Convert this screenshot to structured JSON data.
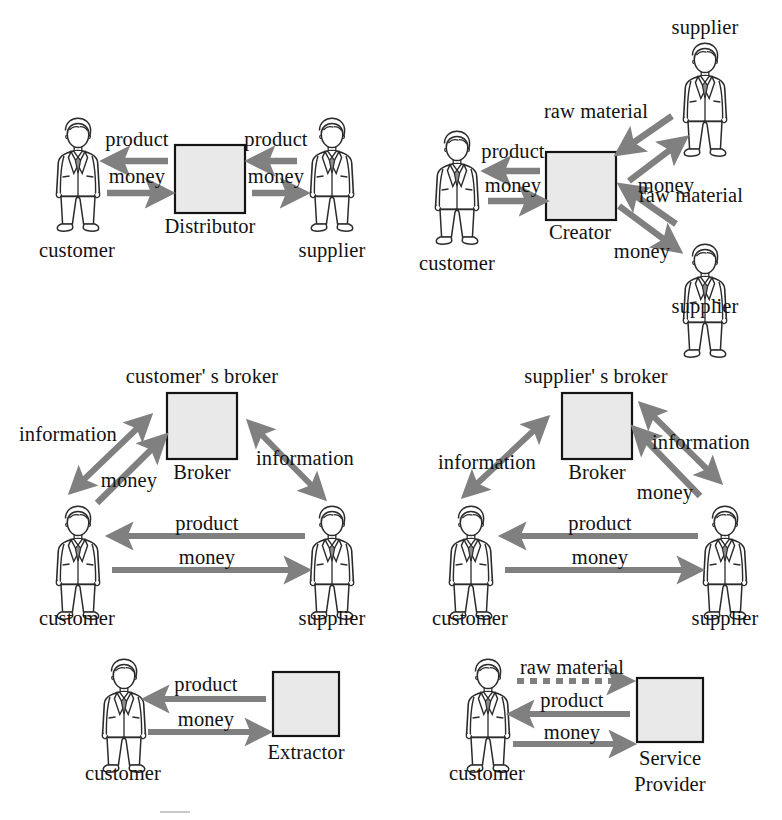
{
  "figure": {
    "panel_count": 6,
    "colors": {
      "arrow_gray": "#808080",
      "box_fill": "#e9e9e9",
      "box_border": "#141414",
      "person_outline": "#2b2b2b",
      "text": "#121212",
      "background": "#ffffff"
    }
  },
  "panels": [
    {
      "id": "distributor",
      "name": "Distributor model",
      "actors": [
        {
          "role": "person",
          "label": "customer"
        },
        {
          "role": "box",
          "label": "Distributor"
        },
        {
          "role": "person",
          "label": "supplier"
        }
      ],
      "flows": [
        {
          "label": "product",
          "from": "Distributor",
          "to": "customer",
          "direction": "left",
          "style": "solid"
        },
        {
          "label": "money",
          "from": "customer",
          "to": "Distributor",
          "direction": "right",
          "style": "solid"
        },
        {
          "label": "product",
          "from": "supplier",
          "to": "Distributor",
          "direction": "left",
          "style": "solid"
        },
        {
          "label": "money",
          "from": "Distributor",
          "to": "supplier",
          "direction": "right",
          "style": "solid"
        }
      ]
    },
    {
      "id": "creator",
      "name": "Creator model",
      "actors": [
        {
          "role": "person",
          "label": "customer"
        },
        {
          "role": "box",
          "label": "Creator"
        },
        {
          "role": "person",
          "label": "supplier"
        },
        {
          "role": "person",
          "label": "supplier"
        }
      ],
      "flows": [
        {
          "label": "product",
          "from": "Creator",
          "to": "customer",
          "direction": "left",
          "style": "solid"
        },
        {
          "label": "money",
          "from": "customer",
          "to": "Creator",
          "direction": "right",
          "style": "solid"
        },
        {
          "label": "raw material",
          "from": "supplier",
          "to": "Creator",
          "direction": "down-left",
          "style": "solid"
        },
        {
          "label": "money",
          "from": "Creator",
          "to": "supplier",
          "direction": "up-right",
          "style": "solid"
        },
        {
          "label": "raw material",
          "from": "supplier",
          "to": "Creator",
          "direction": "up-left",
          "style": "solid"
        },
        {
          "label": "money",
          "from": "Creator",
          "to": "supplier",
          "direction": "down-right",
          "style": "solid"
        }
      ]
    },
    {
      "id": "customers-broker",
      "name": "Customer's broker model",
      "heading": "customer' s broker",
      "actors": [
        {
          "role": "person",
          "label": "customer"
        },
        {
          "role": "box",
          "label": "Broker"
        },
        {
          "role": "person",
          "label": "supplier"
        }
      ],
      "flows": [
        {
          "label": "information",
          "from": "customer",
          "to": "Broker",
          "direction": "bidirectional",
          "style": "solid"
        },
        {
          "label": "money",
          "from": "customer",
          "to": "Broker",
          "direction": "up-right",
          "style": "solid"
        },
        {
          "label": "information",
          "from": "Broker",
          "to": "supplier",
          "direction": "bidirectional",
          "style": "solid"
        },
        {
          "label": "product",
          "from": "supplier",
          "to": "customer",
          "direction": "left",
          "style": "solid"
        },
        {
          "label": "money",
          "from": "customer",
          "to": "supplier",
          "direction": "right",
          "style": "solid"
        }
      ]
    },
    {
      "id": "suppliers-broker",
      "name": "Supplier's broker model",
      "heading": "supplier' s broker",
      "actors": [
        {
          "role": "person",
          "label": "customer"
        },
        {
          "role": "box",
          "label": "Broker"
        },
        {
          "role": "person",
          "label": "supplier"
        }
      ],
      "flows": [
        {
          "label": "information",
          "from": "customer",
          "to": "Broker",
          "direction": "bidirectional",
          "style": "solid"
        },
        {
          "label": "information",
          "from": "Broker",
          "to": "supplier",
          "direction": "bidirectional",
          "style": "solid"
        },
        {
          "label": "money",
          "from": "supplier",
          "to": "Broker",
          "direction": "up-left",
          "style": "solid"
        },
        {
          "label": "product",
          "from": "supplier",
          "to": "customer",
          "direction": "left",
          "style": "solid"
        },
        {
          "label": "money",
          "from": "customer",
          "to": "supplier",
          "direction": "right",
          "style": "solid"
        }
      ]
    },
    {
      "id": "extractor",
      "name": "Extractor model",
      "actors": [
        {
          "role": "person",
          "label": "customer"
        },
        {
          "role": "box",
          "label": "Extractor"
        }
      ],
      "flows": [
        {
          "label": "product",
          "from": "Extractor",
          "to": "customer",
          "direction": "left",
          "style": "solid"
        },
        {
          "label": "money",
          "from": "customer",
          "to": "Extractor",
          "direction": "right",
          "style": "solid"
        }
      ]
    },
    {
      "id": "service-provider",
      "name": "Service Provider model",
      "actors": [
        {
          "role": "person",
          "label": "customer"
        },
        {
          "role": "box",
          "label": "Service\nProvider",
          "label_line1": "Service",
          "label_line2": "Provider"
        }
      ],
      "flows": [
        {
          "label": "raw material",
          "from": "customer",
          "to": "Service Provider",
          "direction": "right",
          "style": "dashed"
        },
        {
          "label": "product",
          "from": "Service Provider",
          "to": "customer",
          "direction": "left",
          "style": "solid"
        },
        {
          "label": "money",
          "from": "customer",
          "to": "Service Provider",
          "direction": "right",
          "style": "solid"
        }
      ]
    }
  ],
  "labels": {
    "p1_product_left": "product",
    "p1_money_left": "money",
    "p1_product_right": "product",
    "p1_money_right": "money",
    "p1_customer": "customer",
    "p1_box": "Distributor",
    "p1_supplier": "supplier",
    "p2_supplier_top": "supplier",
    "p2_raw_top": "raw material",
    "p2_money_top": "money",
    "p2_raw_bottom": "raw material",
    "p2_money_bottom": "money",
    "p2_product": "product",
    "p2_money_left": "money",
    "p2_customer": "customer",
    "p2_box": "Creator",
    "p2_supplier_bottom": "supplier",
    "p3_heading": "customer' s broker",
    "p3_information_left": "information",
    "p3_money_left": "money",
    "p3_box": "Broker",
    "p3_information_right": "information",
    "p3_product": "product",
    "p3_money": "money",
    "p3_customer": "customer",
    "p3_supplier": "supplier",
    "p4_heading": "supplier' s broker",
    "p4_information_left": "information",
    "p4_box": "Broker",
    "p4_information_right": "information",
    "p4_money_right": "money",
    "p4_product": "product",
    "p4_money": "money",
    "p4_customer": "customer",
    "p4_supplier": "supplier",
    "p5_product": "product",
    "p5_money": "money",
    "p5_customer": "customer",
    "p5_box": "Extractor",
    "p6_raw": "raw material",
    "p6_product": "product",
    "p6_money": "money",
    "p6_customer": "customer",
    "p6_box_line1": "Service",
    "p6_box_line2": "Provider"
  }
}
